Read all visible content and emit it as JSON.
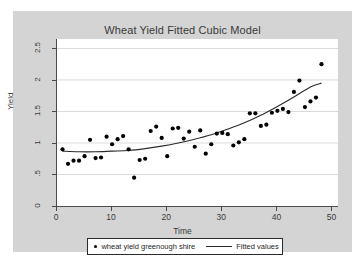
{
  "chart_data": {
    "type": "scatter",
    "title": "Wheat Yield Fitted Cubic Model",
    "xlabel": "Time",
    "ylabel": "Yield",
    "xlim": [
      0,
      51
    ],
    "ylim": [
      0,
      2.65
    ],
    "grid": "horizontal",
    "xticks": [
      "0",
      "10",
      "20",
      "30",
      "40",
      "50"
    ],
    "xtick_values": [
      0,
      10,
      20,
      30,
      40,
      50
    ],
    "yticks": [
      "0",
      ".5",
      "1",
      "1.5",
      "2",
      "2.5"
    ],
    "ytick_values": [
      0,
      0.5,
      1,
      1.5,
      2,
      2.5
    ],
    "legend_position": "bottom",
    "series": [
      {
        "name": "wheat yield greenough shire",
        "type": "scatter",
        "marker": "circle",
        "color": "#000000",
        "x": [
          1,
          2,
          3,
          4,
          5,
          6,
          7,
          8,
          9,
          10,
          11,
          12,
          13,
          14,
          15,
          16,
          17,
          18,
          19,
          20,
          21,
          22,
          23,
          24,
          25,
          26,
          27,
          28,
          29,
          30,
          31,
          32,
          33,
          34,
          35,
          36,
          37,
          38,
          39,
          40,
          41,
          42,
          43,
          44,
          45,
          46,
          47,
          48
        ],
        "y": [
          0.9,
          0.67,
          0.72,
          0.72,
          0.79,
          1.05,
          0.76,
          0.77,
          1.1,
          0.98,
          1.06,
          1.11,
          0.9,
          0.45,
          0.73,
          0.75,
          1.19,
          1.26,
          1.08,
          0.79,
          1.23,
          1.24,
          1.07,
          1.18,
          0.94,
          1.2,
          0.83,
          0.98,
          1.15,
          1.16,
          1.14,
          0.96,
          1.01,
          1.06,
          1.47,
          1.47,
          1.27,
          1.29,
          1.48,
          1.51,
          1.54,
          1.49,
          1.81,
          1.99,
          1.57,
          1.66,
          1.72,
          2.25
        ]
      },
      {
        "name": "Fitted values",
        "type": "line",
        "color": "#2b2b2b",
        "x": [
          1,
          4,
          7,
          10,
          13,
          16,
          19,
          22,
          25,
          28,
          31,
          34,
          37,
          40,
          43,
          46,
          48
        ],
        "y": [
          0.87,
          0.86,
          0.86,
          0.87,
          0.88,
          0.91,
          0.95,
          1.0,
          1.06,
          1.13,
          1.22,
          1.32,
          1.44,
          1.58,
          1.73,
          1.89,
          1.95
        ]
      }
    ]
  },
  "title": "Wheat Yield Fitted Cubic Model",
  "axes": {
    "xlabel": "Time",
    "ylabel": "Yield"
  },
  "legend": {
    "scatter_label": "wheat yield greenough shire",
    "line_label": "Fitted values"
  },
  "colors": {
    "graph_region": "#d4d4d4",
    "plot_background": "#ffffff",
    "marker": "#000000",
    "line": "#2b2b2b",
    "gridline": "#d0d0d0",
    "axis": "#4a4a4a",
    "text": "#3a3a3a"
  }
}
